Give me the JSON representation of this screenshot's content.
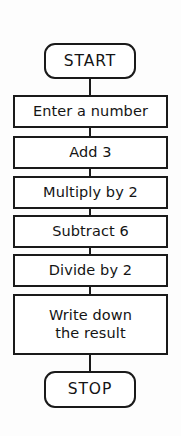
{
  "diagram": {
    "type": "flowchart",
    "orientation": "vertical",
    "background_color": "#fdfdfd",
    "line_color": "#1a1a1a",
    "fill_color": "#ffffff",
    "nodes": [
      {
        "id": "start",
        "label": "START",
        "shape": "terminator",
        "x": 44,
        "y": 43,
        "width": 92,
        "height": 36
      },
      {
        "id": "enter-a-number",
        "label": "Enter a number",
        "shape": "process",
        "x": 13,
        "y": 95,
        "width": 155,
        "height": 33
      },
      {
        "id": "add-3",
        "label": "Add 3",
        "shape": "process",
        "x": 13,
        "y": 136,
        "width": 155,
        "height": 33
      },
      {
        "id": "multiply-by-2",
        "label": "Multiply by 2",
        "shape": "process",
        "x": 13,
        "y": 176,
        "width": 155,
        "height": 33
      },
      {
        "id": "subtract-6",
        "label": "Subtract 6",
        "shape": "process",
        "x": 13,
        "y": 215,
        "width": 155,
        "height": 33
      },
      {
        "id": "divide-by-2",
        "label": "Divide by 2",
        "shape": "process",
        "x": 13,
        "y": 254,
        "width": 155,
        "height": 33
      },
      {
        "id": "write-down-the-result",
        "label": "Write down\nthe result",
        "shape": "process",
        "x": 13,
        "y": 294,
        "width": 155,
        "height": 61
      },
      {
        "id": "stop",
        "label": "STOP",
        "shape": "terminator",
        "x": 44,
        "y": 371,
        "width": 92,
        "height": 37
      }
    ],
    "connectors": [
      {
        "id": "start-to-enter",
        "from": "start",
        "to": "enter-a-number",
        "x": 89,
        "y": 79,
        "height": 16
      },
      {
        "id": "enter-to-add",
        "from": "enter-a-number",
        "to": "add-3",
        "x": 89,
        "y": 128,
        "height": 8
      },
      {
        "id": "add-to-multiply",
        "from": "add-3",
        "to": "multiply-by-2",
        "x": 89,
        "y": 169,
        "height": 7
      },
      {
        "id": "multiply-to-subtract",
        "from": "multiply-by-2",
        "to": "subtract-6",
        "x": 89,
        "y": 209,
        "height": 6
      },
      {
        "id": "subtract-to-divide",
        "from": "subtract-6",
        "to": "divide-by-2",
        "x": 89,
        "y": 248,
        "height": 6
      },
      {
        "id": "divide-to-write",
        "from": "divide-by-2",
        "to": "write-down-the-result",
        "x": 89,
        "y": 287,
        "height": 7
      },
      {
        "id": "write-to-stop",
        "from": "write-down-the-result",
        "to": "stop",
        "x": 89,
        "y": 355,
        "height": 16
      }
    ]
  }
}
